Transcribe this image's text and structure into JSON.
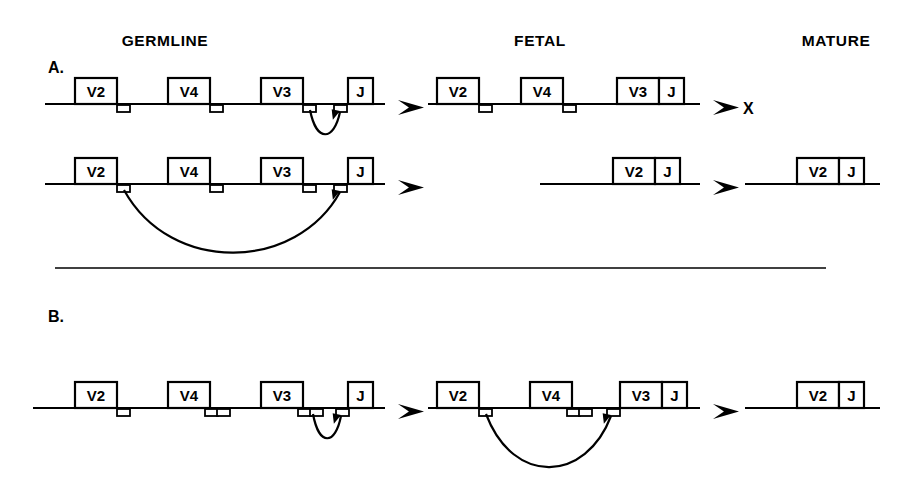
{
  "figure": {
    "width": 913,
    "height": 479,
    "background": "#ffffff",
    "ink_color": "#000000"
  },
  "column_headers": [
    {
      "label": "GERMLINE",
      "x": 165
    },
    {
      "label": "FETAL",
      "x": 540
    },
    {
      "label": "MATURE",
      "x": 836
    }
  ],
  "panels": [
    {
      "id": "A",
      "label": "A.",
      "label_x": 48,
      "label_y": 73,
      "rows": [
        {
          "id": "A1",
          "outcome": "non-productive",
          "outcome_mark": "X",
          "segments": [
            {
              "stage": "germline",
              "line": {
                "x1": 45,
                "x2": 385,
                "y": 104
              },
              "genes": [
                {
                  "label": "V2",
                  "x": 75,
                  "w": 42
                },
                {
                  "label": "V4",
                  "x": 168,
                  "w": 42
                },
                {
                  "label": "V3",
                  "x": 261,
                  "w": 42
                },
                {
                  "label": "J",
                  "x": 348,
                  "w": 25
                }
              ],
              "rss": [
                {
                  "x": 117
                },
                {
                  "x": 210
                },
                {
                  "x": 303
                },
                {
                  "x": 334
                }
              ],
              "arc": {
                "from": 310,
                "to": 340,
                "depth": 20
              }
            },
            {
              "stage": "fetal",
              "line": {
                "x1": 428,
                "x2": 700,
                "y": 104
              },
              "genes": [
                {
                  "label": "V2",
                  "x": 437,
                  "w": 42
                },
                {
                  "label": "V4",
                  "x": 521,
                  "w": 42
                },
                {
                  "label": "V3",
                  "x": 617,
                  "w": 42
                },
                {
                  "label": "J",
                  "x": 659,
                  "w": 25
                }
              ],
              "rss": [
                {
                  "x": 479
                },
                {
                  "x": 563
                }
              ],
              "arc": null
            }
          ],
          "arrows": [
            {
              "x": 398,
              "y": 100
            },
            {
              "x": 713,
              "y": 100
            }
          ]
        },
        {
          "id": "A2",
          "outcome": "productive",
          "outcome_mark": "",
          "segments": [
            {
              "stage": "germline",
              "line": {
                "x1": 45,
                "x2": 385,
                "y": 184
              },
              "genes": [
                {
                  "label": "V2",
                  "x": 75,
                  "w": 42
                },
                {
                  "label": "V4",
                  "x": 168,
                  "w": 42
                },
                {
                  "label": "V3",
                  "x": 261,
                  "w": 42
                },
                {
                  "label": "J",
                  "x": 348,
                  "w": 25
                }
              ],
              "rss": [
                {
                  "x": 117
                },
                {
                  "x": 210
                },
                {
                  "x": 303
                },
                {
                  "x": 334
                }
              ],
              "arc": {
                "from": 124,
                "to": 340,
                "depth": 52
              }
            },
            {
              "stage": "fetal",
              "line": {
                "x1": 540,
                "x2": 700,
                "y": 184
              },
              "genes": [
                {
                  "label": "V2",
                  "x": 613,
                  "w": 42
                },
                {
                  "label": "J",
                  "x": 655,
                  "w": 25
                }
              ],
              "rss": [],
              "arc": null
            },
            {
              "stage": "mature",
              "line": {
                "x1": 745,
                "x2": 880,
                "y": 184
              },
              "genes": [
                {
                  "label": "V2",
                  "x": 797,
                  "w": 42
                },
                {
                  "label": "J",
                  "x": 839,
                  "w": 25
                }
              ],
              "rss": [],
              "arc": null
            }
          ],
          "arrows": [
            {
              "x": 398,
              "y": 180
            },
            {
              "x": 713,
              "y": 180
            }
          ]
        }
      ]
    },
    {
      "id": "B",
      "label": "B.",
      "label_x": 48,
      "label_y": 322,
      "rows": [
        {
          "id": "B1",
          "outcome": "productive",
          "outcome_mark": "",
          "segments": [
            {
              "stage": "germline",
              "line": {
                "x1": 33,
                "x2": 385,
                "y": 408
              },
              "genes": [
                {
                  "label": "V2",
                  "x": 75,
                  "w": 42
                },
                {
                  "label": "V4",
                  "x": 168,
                  "w": 42
                },
                {
                  "label": "V3",
                  "x": 261,
                  "w": 42
                },
                {
                  "label": "J",
                  "x": 348,
                  "w": 25
                }
              ],
              "rss": [
                {
                  "x": 117
                },
                {
                  "x": 205
                },
                {
                  "x": 217
                },
                {
                  "x": 298
                },
                {
                  "x": 310
                },
                {
                  "x": 336
                }
              ],
              "arc": {
                "from": 313,
                "to": 341,
                "depth": 20
              }
            },
            {
              "stage": "fetal",
              "line": {
                "x1": 428,
                "x2": 700,
                "y": 408
              },
              "genes": [
                {
                  "label": "V2",
                  "x": 437,
                  "w": 42
                },
                {
                  "label": "V4",
                  "x": 530,
                  "w": 42
                },
                {
                  "label": "V3",
                  "x": 620,
                  "w": 42
                },
                {
                  "label": "J",
                  "x": 662,
                  "w": 25
                }
              ],
              "rss": [
                {
                  "x": 479
                },
                {
                  "x": 567
                },
                {
                  "x": 579
                },
                {
                  "x": 607
                }
              ],
              "arc": {
                "from": 486,
                "to": 611,
                "depth": 44
              }
            },
            {
              "stage": "mature",
              "line": {
                "x1": 745,
                "x2": 880,
                "y": 408
              },
              "genes": [
                {
                  "label": "V2",
                  "x": 797,
                  "w": 42
                },
                {
                  "label": "J",
                  "x": 839,
                  "w": 25
                }
              ],
              "rss": [],
              "arc": null
            }
          ],
          "arrows": [
            {
              "x": 398,
              "y": 404
            },
            {
              "x": 713,
              "y": 404
            }
          ]
        }
      ]
    }
  ],
  "divider": {
    "x1": 55,
    "x2": 826,
    "y": 268
  },
  "geometry": {
    "box_height": 26,
    "rss_width": 13,
    "rss_height": 7,
    "arrow_width": 26,
    "arrow_height": 15
  }
}
